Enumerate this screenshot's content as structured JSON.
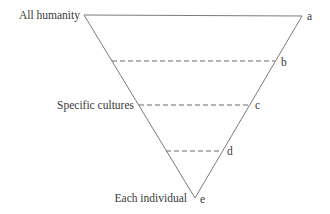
{
  "diagram": {
    "title": "",
    "type": "inverted-triangle",
    "left_labels": {
      "top": "All humanity",
      "middle": "Specific cultures",
      "bottom": "Each individual"
    },
    "point_labels": [
      "a",
      "b",
      "c",
      "d",
      "e"
    ],
    "levels": [
      {
        "id": "a",
        "left_label": "All humanity",
        "line": "solid"
      },
      {
        "id": "b",
        "left_label": "",
        "line": "dashed"
      },
      {
        "id": "c",
        "left_label": "Specific cultures",
        "line": "dashed"
      },
      {
        "id": "d",
        "left_label": "",
        "line": "dashed"
      },
      {
        "id": "e",
        "left_label": "Each individual",
        "line": "apex"
      }
    ],
    "colors": {
      "line": "#7a7a7a",
      "text": "#3a3a3a",
      "background": "#ffffff"
    }
  }
}
